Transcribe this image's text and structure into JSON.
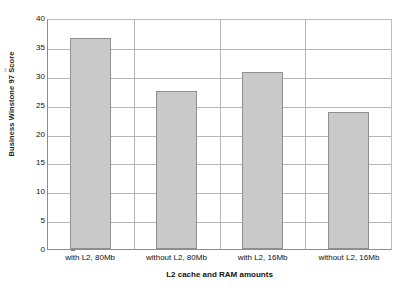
{
  "chart_data": {
    "type": "bar",
    "title": "",
    "categories": [
      "with L2, 80Mb",
      "without L2, 80Mb",
      "with L2, 16Mb",
      "without L2, 16Mb"
    ],
    "values": [
      36.5,
      27.3,
      30.6,
      23.8
    ],
    "xlabel": "L2 cache and RAM amounts",
    "ylabel": "Business Winstone 97 Score",
    "ylim": [
      0,
      40
    ],
    "ytick_step": 5,
    "yticks": [
      40,
      35,
      30,
      25,
      20,
      15,
      10,
      5,
      0
    ],
    "ytick_labels": [
      "40",
      "35",
      "30",
      "25",
      "20",
      "15",
      "10",
      "5",
      "0"
    ],
    "grid": true,
    "grid_axis": "both",
    "legend": false,
    "legend_position": "none",
    "series": [
      {
        "name": "Business Winstone 97 Score",
        "values": [
          36.5,
          27.3,
          30.6,
          23.8
        ],
        "bar_fill_color": "#c9c9c9",
        "bar_border_color": "#8f8f8f"
      }
    ]
  },
  "colors": {
    "background": "#ffffff",
    "bar_fill": "#c9c9c9",
    "bar_border": "#8f8f8f",
    "gridline": "#b5b5b5",
    "axis": "#8c8c8c",
    "text": "#111111"
  }
}
